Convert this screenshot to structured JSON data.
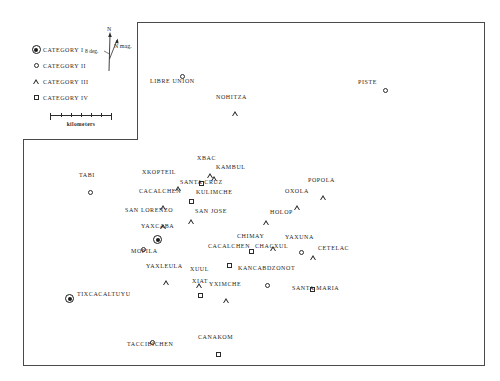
{
  "figure": {
    "background_color": "#ffffff",
    "frame_color": "#4a4a4a"
  },
  "legend": {
    "entries": [
      {
        "symbol": "cat1",
        "label": "CATEGORY  I"
      },
      {
        "symbol": "cat2",
        "label": "CATEGORY  II"
      },
      {
        "symbol": "cat3",
        "label": "CATEGORY  III"
      },
      {
        "symbol": "cat4",
        "label": "CATEGORY  IV"
      }
    ]
  },
  "north_arrow": {
    "true_north_label": "N",
    "magnetic_north_label": "N mag.",
    "declination_label": "8 deg."
  },
  "scale": {
    "label": "kilometers",
    "ticks": 6
  },
  "sites": [
    {
      "name": "LIBRE  UNION",
      "symbol": "cat2",
      "label_x": 150,
      "label_y": 78,
      "sym_x": 180,
      "sym_y": 65
    },
    {
      "name": "NOHITZA",
      "symbol": "cat3",
      "label_x": 216,
      "label_y": 94,
      "sym_x": 232,
      "sym_y": 102
    },
    {
      "name": "PISTE",
      "symbol": "cat2",
      "label_x": 358,
      "label_y": 79,
      "sym_x": 383,
      "sym_y": 79
    },
    {
      "name": "TABI",
      "symbol": "cat2",
      "label_x": 79,
      "label_y": 172,
      "sym_x": 88,
      "sym_y": 181
    },
    {
      "name": "XBAC",
      "symbol": "cat3",
      "label_x": 197,
      "label_y": 155,
      "sym_x": 207,
      "sym_y": 164
    },
    {
      "name": "KAMBUL",
      "symbol": "cat3",
      "label_x": 216,
      "label_y": 164,
      "sym_x": 211,
      "sym_y": 167
    },
    {
      "name": "XKOPTEIL",
      "symbol": "cat3",
      "label_x": 142,
      "label_y": 169,
      "sym_x": 175,
      "sym_y": 177
    },
    {
      "name": "SANTA  CRUZ",
      "symbol": "cat4",
      "label_x": 180,
      "label_y": 179,
      "sym_x": 199,
      "sym_y": 172
    },
    {
      "name": "CACALCHEN",
      "symbol": "cat3",
      "label_x": 139,
      "label_y": 188,
      "sym_x": 160,
      "sym_y": 196
    },
    {
      "name": "KULIMCHE",
      "symbol": "cat4",
      "label_x": 196,
      "label_y": 189,
      "sym_x": 189,
      "sym_y": 190
    },
    {
      "name": "OXOLA",
      "symbol": "cat3",
      "label_x": 285,
      "label_y": 188,
      "sym_x": 294,
      "sym_y": 196
    },
    {
      "name": "POPOLA",
      "symbol": "cat3",
      "label_x": 308,
      "label_y": 177,
      "sym_x": 320,
      "sym_y": 186
    },
    {
      "name": "SAN  LORENZO",
      "symbol": "cat3",
      "label_x": 125,
      "label_y": 207,
      "sym_x": 160,
      "sym_y": 215
    },
    {
      "name": "SAN  JOSE",
      "symbol": "cat3",
      "label_x": 195,
      "label_y": 208,
      "sym_x": 188,
      "sym_y": 210
    },
    {
      "name": "HOLOP",
      "symbol": "cat3",
      "label_x": 270,
      "label_y": 209,
      "sym_x": 263,
      "sym_y": 211
    },
    {
      "name": "YAXCABA",
      "symbol": "cat1",
      "label_x": 141,
      "label_y": 223,
      "sym_x": 153,
      "sym_y": 230
    },
    {
      "name": "MOPILA",
      "symbol": "cat2",
      "label_x": 131,
      "label_y": 248,
      "sym_x": 141,
      "sym_y": 238
    },
    {
      "name": "CHIMAY",
      "symbol": "cat3",
      "label_x": 237,
      "label_y": 233,
      "sym_x": 270,
      "sym_y": 237
    },
    {
      "name": "YAXUNA",
      "symbol": "cat2",
      "label_x": 285,
      "label_y": 234,
      "sym_x": 299,
      "sym_y": 241
    },
    {
      "name": "CACALCHEN",
      "symbol": "cat4",
      "label_x": 208,
      "label_y": 243,
      "sym_x": 227,
      "sym_y": 254
    },
    {
      "name": "CHACXUL",
      "symbol": "cat4",
      "label_x": 255,
      "label_y": 243,
      "sym_x": 249,
      "sym_y": 240
    },
    {
      "name": "CETELAC",
      "symbol": "cat3",
      "label_x": 318,
      "label_y": 245,
      "sym_x": 310,
      "sym_y": 246
    },
    {
      "name": "YAXLEULA",
      "symbol": "cat3",
      "label_x": 146,
      "label_y": 263,
      "sym_x": 163,
      "sym_y": 271
    },
    {
      "name": "XUUL",
      "symbol": "cat3",
      "label_x": 190,
      "label_y": 266,
      "sym_x": 196,
      "sym_y": 274
    },
    {
      "name": "KANCABDZONOT",
      "symbol": "cat2",
      "label_x": 238,
      "label_y": 265,
      "sym_x": 265,
      "sym_y": 274
    },
    {
      "name": "XIAT",
      "symbol": "cat4",
      "label_x": 192,
      "label_y": 278,
      "sym_x": 198,
      "sym_y": 284
    },
    {
      "name": "YXIMCHE",
      "symbol": "cat3",
      "label_x": 209,
      "label_y": 281,
      "sym_x": 223,
      "sym_y": 289
    },
    {
      "name": "SANTA  MARIA",
      "symbol": "cat4",
      "label_x": 292,
      "label_y": 285,
      "sym_x": 310,
      "sym_y": 278
    },
    {
      "name": "TIXCACALTUYU",
      "symbol": "cat1",
      "label_x": 77,
      "label_y": 291,
      "sym_x": 65,
      "sym_y": 289
    },
    {
      "name": "TACCIBICHEN",
      "symbol": "cat2",
      "label_x": 127,
      "label_y": 341,
      "sym_x": 150,
      "sym_y": 331
    },
    {
      "name": "CANAKOM",
      "symbol": "cat4",
      "label_x": 198,
      "label_y": 334,
      "sym_x": 216,
      "sym_y": 343
    }
  ]
}
